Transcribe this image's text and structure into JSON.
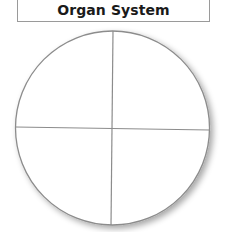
{
  "title": "Organ System",
  "diagram": {
    "shape": "circle",
    "divisions": 4,
    "quadrants": [
      "",
      "",
      "",
      ""
    ],
    "colors": {
      "stroke": "#8c8c8c",
      "fill": "#ffffff",
      "shadow": "#c8c8c8"
    }
  }
}
